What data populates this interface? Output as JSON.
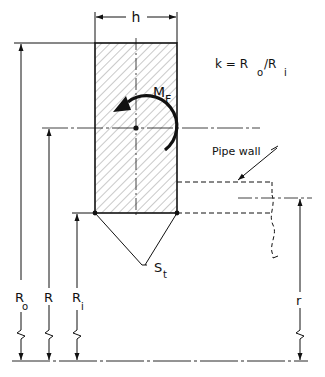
{
  "diagram": {
    "labels": {
      "width": "h",
      "moment": "M",
      "moment_sub": "F",
      "formula_k": "k = R",
      "formula_o": "o",
      "formula_slash": "/R",
      "formula_i": "i",
      "pipe_wall": "Pipe wall",
      "stress": "S",
      "stress_sub": "t",
      "outer_radius": "R",
      "outer_radius_sub": "o",
      "mean_radius": "R",
      "inner_radius": "R",
      "inner_radius_sub": "i",
      "pipe_radius": "r"
    },
    "colors": {
      "ink": "#111111",
      "background": "#ffffff"
    }
  }
}
